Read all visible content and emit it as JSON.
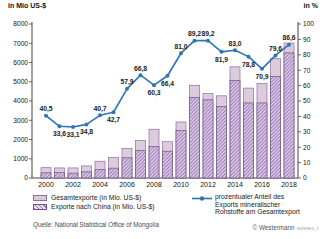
{
  "chart_data": {
    "type": "combo-bar-line",
    "x": [
      2000,
      2001,
      2002,
      2003,
      2004,
      2005,
      2006,
      2007,
      2008,
      2009,
      2010,
      2011,
      2012,
      2013,
      2014,
      2015,
      2016,
      2017,
      2018
    ],
    "x_tick_labels": [
      "2000",
      "2002",
      "2004",
      "2006",
      "2008",
      "2010",
      "2012",
      "2014",
      "2016",
      "2018"
    ],
    "series": [
      {
        "name": "Gesamtexporte (in Mio. US-$)",
        "type": "bar",
        "axis": "left",
        "values": [
          536,
          523,
          524,
          627,
          872,
          1065,
          1543,
          1949,
          2534,
          1885,
          2909,
          4818,
          4385,
          4269,
          5775,
          4670,
          4916,
          6201,
          7012
        ]
      },
      {
        "name": "Exporte nach China (in Mio. US-$)",
        "type": "bar",
        "axis": "left",
        "values": [
          270,
          280,
          250,
          320,
          430,
          510,
          1050,
          1420,
          1640,
          1390,
          2470,
          4180,
          4060,
          3710,
          5070,
          3900,
          3900,
          5270,
          6500
        ]
      },
      {
        "name": "prozentualer Anteil des Exports mineralischer Rohstoffe am Gesamtexport",
        "type": "line",
        "axis": "right",
        "values": [
          40.5,
          33.6,
          33.1,
          34.8,
          40.7,
          42.7,
          57.9,
          66.8,
          60.3,
          66.4,
          81.0,
          89.2,
          89.2,
          81.9,
          83.0,
          78.8,
          70.9,
          79.6,
          86.6
        ]
      }
    ],
    "line_label_below_years": [
      2001,
      2002,
      2003,
      2005,
      2008,
      2009,
      2013,
      2015,
      2016
    ],
    "left_axis": {
      "title": "in Mio US-$",
      "min": 0,
      "max": 8000,
      "step": 1000
    },
    "right_axis": {
      "title": "in %",
      "min": 0,
      "max": 100,
      "step": 10
    },
    "grid": false,
    "colors": {
      "bar_total_fill": "#dccadd",
      "bar_total_stroke": "#8a6f9e",
      "hatch_bg": "#e7dcf0",
      "hatch_stripe": "#9a74b4",
      "bar_china_stroke": "#6f5387",
      "line": "#2e74b8",
      "value_label": "#1a1a1a",
      "axis": "#444444"
    }
  },
  "legend": {
    "items": [
      {
        "label": "Gesamtexporte (in Mio. US-$)",
        "swatch": "solid"
      },
      {
        "label": "Exporte nach China (in Mio. US-$)",
        "swatch": "hatched"
      }
    ],
    "line_item": {
      "line1": "prozentualer Anteil des",
      "line2": "Exports mineralischer",
      "line3": "Rohstoffe am Gesamtexport"
    }
  },
  "footer": {
    "source": "Quelle: National Statistical Office of Mongolia",
    "copyright": "© Westermann",
    "code": "36969EX_1"
  }
}
